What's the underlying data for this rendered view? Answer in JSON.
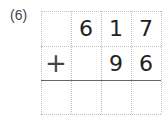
{
  "problem": {
    "label": "(6)",
    "rows": [
      [
        "",
        "6",
        "1",
        "7"
      ],
      [
        "+",
        "",
        "9",
        "6"
      ],
      [
        "",
        "",
        "",
        ""
      ]
    ]
  }
}
